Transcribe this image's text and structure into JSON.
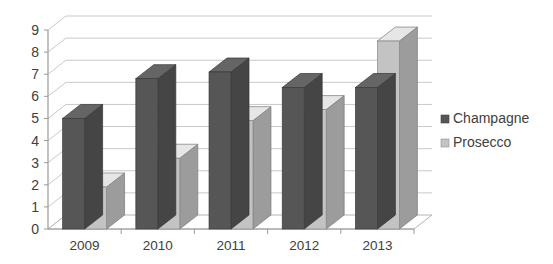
{
  "chart_data": {
    "type": "bar",
    "title": "",
    "subtitle": "",
    "xlabel": "",
    "ylabel": "",
    "categories": [
      "2009",
      "2010",
      "2011",
      "2012",
      "2013"
    ],
    "series": [
      {
        "name": "Champagne",
        "color": "#565656",
        "values": [
          5.0,
          6.8,
          7.1,
          6.4,
          6.4
        ]
      },
      {
        "name": "Prosecco",
        "color": "#c3c3c3",
        "values": [
          1.9,
          3.2,
          4.9,
          5.4,
          8.5
        ]
      }
    ],
    "ylim": [
      0,
      9
    ],
    "ytick_labels": [
      "0",
      "1",
      "2",
      "3",
      "4",
      "5",
      "6",
      "7",
      "8",
      "9"
    ],
    "ytick_values": [
      0,
      1,
      2,
      3,
      4,
      5,
      6,
      7,
      8,
      9
    ],
    "grid": true,
    "grid_axis": "y",
    "legend_position": "right",
    "style_3d": true,
    "background_color": "#ffffff",
    "gridline_color": "#c9c9c9",
    "axis_color": "#9a9a9a",
    "text_color": "#404040"
  },
  "legend": {
    "entries": [
      {
        "label": "Champagne",
        "swatch_color": "#565656"
      },
      {
        "label": "Prosecco",
        "swatch_color": "#c3c3c3"
      }
    ]
  }
}
